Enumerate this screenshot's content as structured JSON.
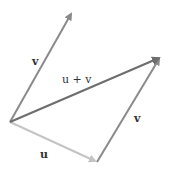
{
  "diagram": {
    "type": "vector-addition",
    "colors": {
      "v": "#8a8a8a",
      "u": "#c4c4c4",
      "sum": "#6e6e6e",
      "label": "#333333"
    },
    "labels": {
      "v_left": "v",
      "sum": "u + v",
      "v_right": "v",
      "u": "u"
    },
    "points": {
      "origin": [
        10,
        122
      ],
      "v_tip": [
        72,
        12
      ],
      "sum_tip": [
        161,
        57
      ],
      "u_tip": [
        97,
        162
      ]
    }
  }
}
